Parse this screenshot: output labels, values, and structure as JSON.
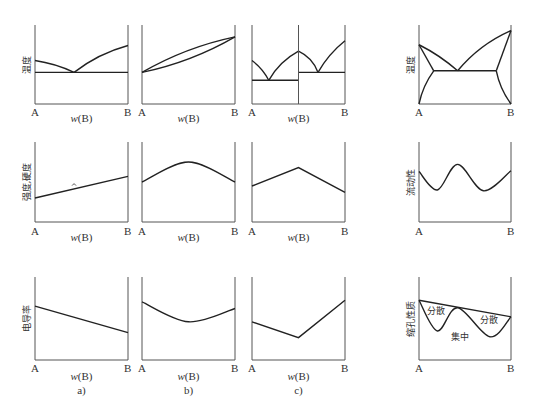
{
  "figure": {
    "x_label": "w(B)",
    "left_end": "A",
    "right_end": "B",
    "columns": [
      {
        "id": "a",
        "caption": "a)"
      },
      {
        "id": "b",
        "caption": "b)"
      },
      {
        "id": "c",
        "caption": "c)"
      },
      {
        "id": "d",
        "caption": ""
      }
    ],
    "rows": [
      {
        "id": "phase",
        "ylabel": "温度",
        "ylabel_d": "温度"
      },
      {
        "id": "property",
        "ylabel": "强度,硬度",
        "ylabel_d": "流动性"
      },
      {
        "id": "conductivity",
        "ylabel": "电导率",
        "ylabel_d": "缩孔性质"
      }
    ],
    "annotations": {
      "dispersed_1": "分散",
      "dispersed_2": "分散",
      "concentrated": "集中"
    }
  },
  "chart_data": [
    {
      "type": "line",
      "panel": "row1-a",
      "title": "eutectic phase diagram",
      "ylabel": "温度",
      "xlabel": "w(B)",
      "xlim": [
        "A",
        "B"
      ],
      "series": [
        {
          "name": "liquidus-left",
          "x": [
            0,
            0.42
          ],
          "y": [
            0.55,
            0.4
          ]
        },
        {
          "name": "liquidus-right",
          "x": [
            0.42,
            1
          ],
          "y": [
            0.4,
            0.74
          ]
        },
        {
          "name": "eutectic-line",
          "x": [
            0,
            1
          ],
          "y": [
            0.4,
            0.4
          ]
        }
      ]
    },
    {
      "type": "line",
      "panel": "row1-b",
      "title": "isomorphous phase diagram",
      "xlabel": "w(B)",
      "series": [
        {
          "name": "liquidus",
          "x": [
            0,
            0.5,
            1
          ],
          "y": [
            0.4,
            0.72,
            0.85
          ]
        },
        {
          "name": "solidus",
          "x": [
            0,
            0.5,
            1
          ],
          "y": [
            0.4,
            0.55,
            0.85
          ]
        }
      ]
    },
    {
      "type": "line",
      "panel": "row1-c",
      "title": "compound-forming phase diagram",
      "xlabel": "w(B)",
      "series": [
        {
          "name": "liquidus-1",
          "x": [
            0,
            0.18
          ],
          "y": [
            0.55,
            0.3
          ]
        },
        {
          "name": "liquidus-2",
          "x": [
            0.18,
            0.5
          ],
          "y": [
            0.3,
            0.67
          ]
        },
        {
          "name": "liquidus-3",
          "x": [
            0.5,
            0.71
          ],
          "y": [
            0.67,
            0.4
          ]
        },
        {
          "name": "liquidus-4",
          "x": [
            0.71,
            1
          ],
          "y": [
            0.4,
            0.8
          ]
        },
        {
          "name": "eutectic-1",
          "x": [
            0,
            0.5
          ],
          "y": [
            0.3,
            0.3
          ]
        },
        {
          "name": "eutectic-2",
          "x": [
            0.5,
            1
          ],
          "y": [
            0.4,
            0.4
          ]
        },
        {
          "name": "compound",
          "x": [
            0.5,
            0.5
          ],
          "y": [
            0,
            1
          ]
        }
      ]
    },
    {
      "type": "line",
      "panel": "row1-d",
      "title": "eutectic with limited solubility",
      "ylabel": "温度",
      "xlabel": "",
      "series": [
        {
          "name": "liquidus-left",
          "x": [
            0,
            0.42
          ],
          "y": [
            0.75,
            0.42
          ]
        },
        {
          "name": "liquidus-right",
          "x": [
            0.42,
            1
          ],
          "y": [
            0.42,
            0.93
          ]
        },
        {
          "name": "solvus-left",
          "x": [
            0,
            0.16
          ],
          "y": [
            0,
            0.42
          ]
        },
        {
          "name": "solidus-left",
          "x": [
            0,
            0.16
          ],
          "y": [
            0.75,
            0.42
          ]
        },
        {
          "name": "solidus-right",
          "x": [
            0.84,
            1
          ],
          "y": [
            0.42,
            0.93
          ]
        },
        {
          "name": "solvus-right",
          "x": [
            0.84,
            1
          ],
          "y": [
            0.42,
            0
          ]
        },
        {
          "name": "eutectic-line",
          "x": [
            0.16,
            0.84
          ],
          "y": [
            0.42,
            0.42
          ]
        }
      ]
    },
    {
      "type": "line",
      "panel": "row2-a",
      "ylabel": "强度,硬度",
      "xlabel": "w(B)",
      "series": [
        {
          "name": "strength",
          "x": [
            0,
            1
          ],
          "y": [
            0.3,
            0.57
          ]
        }
      ]
    },
    {
      "type": "line",
      "panel": "row2-b",
      "xlabel": "w(B)",
      "series": [
        {
          "name": "strength",
          "x": [
            0,
            0.5,
            1
          ],
          "y": [
            0.5,
            0.75,
            0.5
          ]
        }
      ]
    },
    {
      "type": "line",
      "panel": "row2-c",
      "xlabel": "w(B)",
      "series": [
        {
          "name": "strength",
          "x": [
            0,
            0.5,
            1
          ],
          "y": [
            0.45,
            0.68,
            0.37
          ]
        }
      ]
    },
    {
      "type": "line",
      "panel": "row2-d",
      "ylabel": "流动性",
      "xlabel": "",
      "series": [
        {
          "name": "fluidity",
          "x": [
            0,
            0.2,
            0.42,
            0.7,
            1
          ],
          "y": [
            0.63,
            0.4,
            0.72,
            0.39,
            0.64
          ]
        }
      ]
    },
    {
      "type": "line",
      "panel": "row3-a",
      "ylabel": "电导率",
      "xlabel": "w(B)",
      "series": [
        {
          "name": "conductivity",
          "x": [
            0,
            1
          ],
          "y": [
            0.65,
            0.33
          ]
        }
      ]
    },
    {
      "type": "line",
      "panel": "row3-b",
      "xlabel": "w(B)",
      "series": [
        {
          "name": "conductivity",
          "x": [
            0,
            0.5,
            1
          ],
          "y": [
            0.7,
            0.46,
            0.62
          ]
        }
      ]
    },
    {
      "type": "line",
      "panel": "row3-c",
      "xlabel": "w(B)",
      "series": [
        {
          "name": "conductivity",
          "x": [
            0,
            0.5,
            1
          ],
          "y": [
            0.46,
            0.27,
            0.72
          ]
        }
      ]
    },
    {
      "type": "line",
      "panel": "row3-d",
      "ylabel": "缩孔性质",
      "xlabel": "",
      "series": [
        {
          "name": "upper-line",
          "x": [
            0,
            1
          ],
          "y": [
            0.72,
            0.52
          ]
        },
        {
          "name": "shrinkage",
          "x": [
            0,
            0.2,
            0.42,
            0.77,
            1
          ],
          "y": [
            0.72,
            0.35,
            0.63,
            0.28,
            0.52
          ]
        }
      ],
      "annotations": [
        "分散",
        "分散",
        "集中"
      ]
    }
  ]
}
